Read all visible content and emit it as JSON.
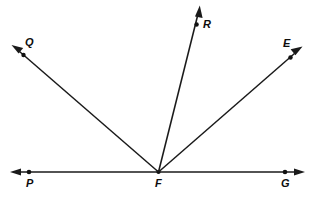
{
  "figure": {
    "type": "geometry-diagram",
    "width": 313,
    "height": 198,
    "background_color": "#ffffff",
    "stroke_color": "#1a1a1a",
    "label_color": "#0d0d0d",
    "vertex": {
      "name": "F",
      "label": "F",
      "x": 158,
      "y": 172,
      "label_x": 155,
      "label_y": 179
    },
    "base_line": {
      "name": "line-PG",
      "x1": 12,
      "y1": 172,
      "x2": 303,
      "y2": 172,
      "arrow_left": true,
      "arrow_right": true
    },
    "points": [
      {
        "name": "P",
        "label": "P",
        "x": 29,
        "y": 172,
        "label_x": 26,
        "label_y": 179
      },
      {
        "name": "G",
        "label": "G",
        "x": 285,
        "y": 172,
        "label_x": 281,
        "label_y": 179
      }
    ],
    "rays": [
      {
        "name": "ray-FQ",
        "label": "Q",
        "tip_x": 13,
        "tip_y": 47,
        "dot_x": 23,
        "dot_y": 55,
        "label_x": 24,
        "label_y": 38,
        "angle_deg": 139
      },
      {
        "name": "ray-FR",
        "label": "R",
        "tip_x": 199,
        "tip_y": 7,
        "dot_x": 197,
        "dot_y": 24,
        "label_x": 203,
        "label_y": 19,
        "angle_deg": 76
      },
      {
        "name": "ray-FE",
        "label": "E",
        "tip_x": 300,
        "tip_y": 48,
        "dot_x": 291,
        "dot_y": 57,
        "label_x": 283,
        "label_y": 38,
        "angle_deg": 41
      }
    ]
  }
}
